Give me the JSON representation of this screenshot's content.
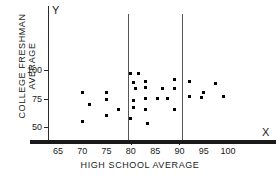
{
  "chart_data": {
    "type": "scatter",
    "title": "",
    "xlabel": "HIGH SCHOOL AVERAGE",
    "ylabel": "COLLEGE FRESHMAN AVERAGE",
    "x_axis_letter": "X",
    "y_axis_letter": "Y",
    "xlim": [
      62,
      103
    ],
    "ylim": [
      42,
      105
    ],
    "xticks": [
      65,
      70,
      75,
      80,
      85,
      90,
      95,
      100
    ],
    "yticks": [
      50,
      75,
      100
    ],
    "grid": false,
    "legend": null,
    "vertical_reference_lines": [
      79.5,
      90.5
    ],
    "points": [
      {
        "x": 70.0,
        "y": 80.0
      },
      {
        "x": 70.0,
        "y": 55.0
      },
      {
        "x": 71.5,
        "y": 70.0
      },
      {
        "x": 75.0,
        "y": 80.0
      },
      {
        "x": 75.0,
        "y": 74.0
      },
      {
        "x": 75.0,
        "y": 60.0
      },
      {
        "x": 77.5,
        "y": 65.0
      },
      {
        "x": 80.0,
        "y": 97.0
      },
      {
        "x": 81.5,
        "y": 97.0
      },
      {
        "x": 80.5,
        "y": 89.0
      },
      {
        "x": 81.0,
        "y": 84.0
      },
      {
        "x": 80.5,
        "y": 73.0
      },
      {
        "x": 80.5,
        "y": 67.0
      },
      {
        "x": 80.0,
        "y": 57.5
      },
      {
        "x": 83.0,
        "y": 90.0
      },
      {
        "x": 83.0,
        "y": 85.0
      },
      {
        "x": 83.0,
        "y": 75.0
      },
      {
        "x": 83.0,
        "y": 65.0
      },
      {
        "x": 83.5,
        "y": 53.0
      },
      {
        "x": 85.5,
        "y": 75.0
      },
      {
        "x": 86.5,
        "y": 84.0
      },
      {
        "x": 87.5,
        "y": 75.0
      },
      {
        "x": 89.0,
        "y": 92.0
      },
      {
        "x": 89.0,
        "y": 84.0
      },
      {
        "x": 89.0,
        "y": 65.0
      },
      {
        "x": 92.0,
        "y": 90.0
      },
      {
        "x": 92.0,
        "y": 77.0
      },
      {
        "x": 94.5,
        "y": 76.0
      },
      {
        "x": 95.0,
        "y": 80.0
      },
      {
        "x": 97.5,
        "y": 88.0
      },
      {
        "x": 99.0,
        "y": 76.5
      }
    ]
  }
}
